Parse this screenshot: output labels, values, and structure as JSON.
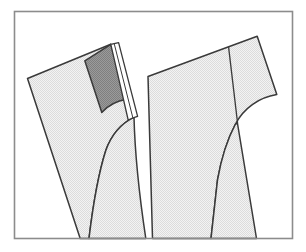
{
  "figure": {
    "title": "Garment pattern pieces technical line drawing",
    "type": "line-drawing",
    "width": 306,
    "height": 252,
    "background_color": "#ffffff",
    "frame": {
      "label": "figure-border",
      "x": 14,
      "y": 11,
      "width": 278,
      "height": 227,
      "stroke_color": "#8c8c8c",
      "stroke_width": 1.6,
      "fill": "none"
    },
    "palette": {
      "outline": "#3a3a3a",
      "light_fill": "#e9e9e9",
      "dark_fill": "#8f8f8f",
      "white_fill": "#ffffff",
      "frame": "#8c8c8c",
      "seam_line": "#3a3a3a"
    },
    "shapes": [
      {
        "id": "left-panel-body",
        "label": "left garment panel",
        "fill": "light_fill",
        "stroke": "outline",
        "stroke_width": 1.5,
        "path": "M 27.5 78 L 110.5 44.5 L 127 100 L 133 116 C 122 121 111 132 105 150 C 98 174 92 208 88.5 238 L 80 238 L 27.5 78 Z",
        "note": "large quadrilateral with concave right curve running to bottom edge"
      },
      {
        "id": "left-panel-lower",
        "label": "left panel lower leg",
        "fill": "light_fill",
        "stroke": "outline",
        "stroke_width": 1.5,
        "path": "M 27.5 78 L 80 238 L 145.5 238 C 139 200 133 160 133 116 L 127 100 Z"
      },
      {
        "id": "left-panel-dark-inset",
        "label": "shaded facing panel",
        "fill": "dark_fill",
        "stroke": "outline",
        "stroke_width": 1.5,
        "path": "M 84.5 60.5 L 110.5 44.5 L 126.5 99.5 C 118 100.5 109 104.5 101.5 112 L 84.5 60.5 Z",
        "note": "dark dithered parallelogram at upper edge of left panel"
      },
      {
        "id": "left-panel-fold-strip",
        "label": "white folded seam allowance strip",
        "fill": "white_fill",
        "stroke": "outline",
        "stroke_width": 1.3,
        "path": "M 110.5 44.5 L 118 43 L 136.5 116 L 127.5 117.5 Z",
        "note": "narrow white band with interior crease line"
      },
      {
        "id": "left-panel-fold-crease",
        "label": "fold crease line",
        "stroke": "outline",
        "stroke_width": 1.1,
        "fill": "none",
        "path": "M 114 44 L 132 117"
      },
      {
        "id": "right-panel-body",
        "label": "right garment panel",
        "fill": "light_fill",
        "stroke": "outline",
        "stroke_width": 1.5,
        "path": "M 148 76.5 L 257 36 L 276.5 94.5 C 260 97 244 107 234 124 C 226 138 221 157 218 177 L 214 238 L 152 238 L 148 76.5 Z"
      },
      {
        "id": "right-panel-lower",
        "label": "right panel lower leg",
        "fill": "light_fill",
        "stroke": "outline",
        "stroke_width": 1.5,
        "path": "M 148 76.5 L 152 238 L 256 238 L 234 124 C 244 107 260 97 276.5 94.5 L 257 36 Z"
      },
      {
        "id": "right-panel-seam-line",
        "label": "vertical seam line",
        "stroke": "seam_line",
        "stroke_width": 1.3,
        "fill": "none",
        "path": "M 228.5 47 L 237 123"
      }
    ],
    "annotations": [],
    "legend": []
  }
}
